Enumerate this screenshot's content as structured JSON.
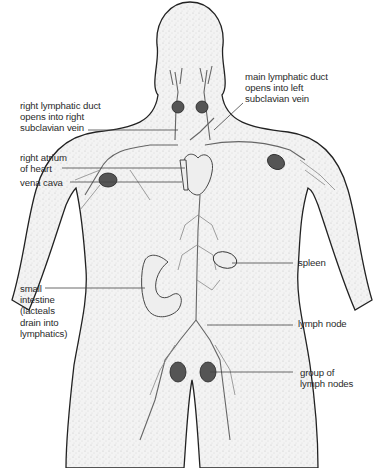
{
  "diagram": {
    "labels": {
      "right_lymphatic_duct": "right lymphatic duct\nopens into right\nsubclavian vein",
      "main_lymphatic_duct": "main lymphatic duct\nopens into left\nsubclavian vein",
      "right_atrium": "right atrium\nof heart",
      "vena_cava": "vena cava",
      "spleen": "spleen",
      "small_intestine": "small\nintestine\n(lacteals\ndrain into\nlymphatics)",
      "lymph_node": "lymph node",
      "group_of_lymph_nodes": "group of\nlymph nodes"
    }
  }
}
